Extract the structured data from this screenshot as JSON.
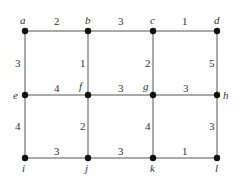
{
  "graph": {
    "nodes": [
      {
        "id": "a",
        "label": "a",
        "x": 25,
        "y": 31,
        "lx": 20,
        "ly": 24
      },
      {
        "id": "b",
        "label": "b",
        "x": 88,
        "y": 31,
        "lx": 85,
        "ly": 24
      },
      {
        "id": "c",
        "label": "c",
        "x": 153,
        "y": 31,
        "lx": 150,
        "ly": 24
      },
      {
        "id": "d",
        "label": "d",
        "x": 217,
        "y": 31,
        "lx": 214,
        "ly": 24
      },
      {
        "id": "e",
        "label": "e",
        "x": 25,
        "y": 95,
        "lx": 13,
        "ly": 99
      },
      {
        "id": "f",
        "label": "f",
        "x": 88,
        "y": 95,
        "lx": 79,
        "ly": 90
      },
      {
        "id": "g",
        "label": "g",
        "x": 153,
        "y": 95,
        "lx": 143,
        "ly": 90
      },
      {
        "id": "h",
        "label": "h",
        "x": 217,
        "y": 95,
        "lx": 223,
        "ly": 99
      },
      {
        "id": "i",
        "label": "i",
        "x": 25,
        "y": 158,
        "lx": 22,
        "ly": 172
      },
      {
        "id": "j",
        "label": "j",
        "x": 88,
        "y": 158,
        "lx": 85,
        "ly": 172
      },
      {
        "id": "k",
        "label": "k",
        "x": 153,
        "y": 158,
        "lx": 150,
        "ly": 172
      },
      {
        "id": "l",
        "label": "l",
        "x": 217,
        "y": 158,
        "lx": 215,
        "ly": 172
      }
    ],
    "edges": [
      {
        "from": "a",
        "to": "b",
        "weight": "2",
        "wx": 54,
        "wy": 25
      },
      {
        "from": "b",
        "to": "c",
        "weight": "3",
        "wx": 118,
        "wy": 25
      },
      {
        "from": "c",
        "to": "d",
        "weight": "1",
        "wx": 182,
        "wy": 25
      },
      {
        "from": "a",
        "to": "e",
        "weight": "3",
        "wx": 15,
        "wy": 67
      },
      {
        "from": "b",
        "to": "f",
        "weight": "1",
        "wx": 80,
        "wy": 67
      },
      {
        "from": "c",
        "to": "g",
        "weight": "2",
        "wx": 145,
        "wy": 67
      },
      {
        "from": "d",
        "to": "h",
        "weight": "5",
        "wx": 209,
        "wy": 67
      },
      {
        "from": "e",
        "to": "f",
        "weight": "4",
        "wx": 54,
        "wy": 92
      },
      {
        "from": "f",
        "to": "g",
        "weight": "3",
        "wx": 118,
        "wy": 92
      },
      {
        "from": "g",
        "to": "h",
        "weight": "3",
        "wx": 183,
        "wy": 92
      },
      {
        "from": "e",
        "to": "i",
        "weight": "4",
        "wx": 15,
        "wy": 130
      },
      {
        "from": "f",
        "to": "j",
        "weight": "2",
        "wx": 80,
        "wy": 130
      },
      {
        "from": "g",
        "to": "k",
        "weight": "4",
        "wx": 145,
        "wy": 130
      },
      {
        "from": "h",
        "to": "l",
        "weight": "3",
        "wx": 209,
        "wy": 130
      },
      {
        "from": "i",
        "to": "j",
        "weight": "3",
        "wx": 54,
        "wy": 155
      },
      {
        "from": "j",
        "to": "k",
        "weight": "3",
        "wx": 118,
        "wy": 155
      },
      {
        "from": "k",
        "to": "l",
        "weight": "1",
        "wx": 182,
        "wy": 155
      }
    ]
  }
}
